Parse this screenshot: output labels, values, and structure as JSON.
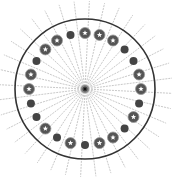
{
  "diagram": {
    "center": [
      85,
      89
    ],
    "outer_ring_radius": 70,
    "dot_ring_radius": 56,
    "spoke_count": 36,
    "spoke_length": 88,
    "colors": {
      "ring": "#333333",
      "spoke": "#b0b0b0",
      "dark_dot": "#444444",
      "star_dot": "#555555",
      "star": "#ffffff"
    },
    "dots": [
      "dark",
      "star",
      "star",
      "star",
      "dark",
      "dark",
      "star",
      "star",
      "dark",
      "star",
      "dark",
      "star",
      "star",
      "dark",
      "star",
      "dark",
      "star",
      "dark",
      "dark",
      "star",
      "star",
      "dark",
      "star",
      "star"
    ],
    "dot_start_angle_deg": -105
  }
}
